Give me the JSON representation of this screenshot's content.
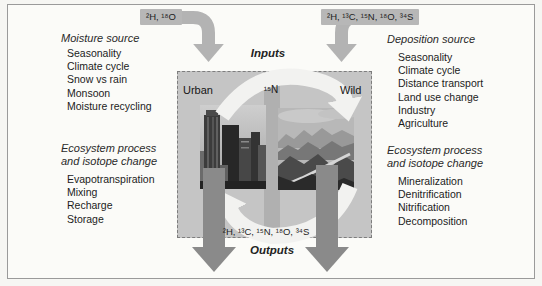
{
  "figure": {
    "inputs_label": "Inputs",
    "outputs_label": "Outputs",
    "input_left_isotopes": "²H, ¹⁸O",
    "input_right_isotopes": "²H, ¹³C, ¹⁵N, ¹⁸O, ³⁴S",
    "center_isotope": "¹⁵N",
    "output_isotopes": "²H, ¹³C, ¹⁵N, ¹⁸O, ³⁴S",
    "urban_label": "Urban",
    "wild_label": "Wild"
  },
  "moisture": {
    "heading": "Moisture source",
    "items": [
      "Seasonality",
      "Climate cycle",
      "Snow vs rain",
      "Monsoon",
      "Moisture recycling"
    ]
  },
  "deposition": {
    "heading": "Deposition source",
    "items": [
      "Seasonality",
      "Climate cycle",
      "Distance transport",
      "Land use change",
      "Industry",
      "Agriculture"
    ]
  },
  "left_process": {
    "heading_line1": "Ecosystem process",
    "heading_line2": "and isotope change",
    "items": [
      "Evapotranspiration",
      "Mixing",
      "Recharge",
      "Storage"
    ]
  },
  "right_process": {
    "heading_line1": "Ecosystem process",
    "heading_line2": "and isotope change",
    "items": [
      "Mineralization",
      "Denitrification",
      "Nitrification",
      "Decomposition"
    ]
  },
  "colors": {
    "box_fill": "#c5c5c5",
    "center_strip": "#b0b0b0",
    "input_arrow": "#b3b3b3",
    "isotope_chip_bg": "#b7b7b7",
    "output_arrow": "#8a8a8a",
    "cycle_arrow": "#f2f2f0"
  }
}
